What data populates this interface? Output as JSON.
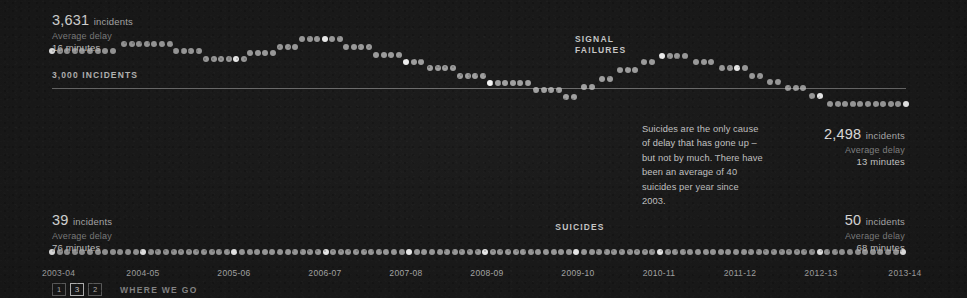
{
  "background_color": "#1a1a1a",
  "dot_color": "#c9c9c9",
  "dot_color_highlight": "#ffffff",
  "reference": {
    "label": "3,000 INCIDENTS",
    "value": 3000
  },
  "series_labels": {
    "signal_failures": "SIGNAL\nFAILURES",
    "signal_failures_line1": "SIGNAL",
    "signal_failures_line2": "FAILURES",
    "suicides": "SUICIDES"
  },
  "stats": {
    "signal_start": {
      "value": "3,631",
      "unit": "incidents",
      "sub": "Average delay",
      "delay": "16 minutes"
    },
    "signal_end": {
      "value": "2,498",
      "unit": "incidents",
      "sub": "Average delay",
      "delay": "13 minutes"
    },
    "suicides_start": {
      "value": "39",
      "unit": "incidents",
      "sub": "Average delay",
      "delay": "76 minutes"
    },
    "suicides_end": {
      "value": "50",
      "unit": "incidents",
      "sub": "Average delay",
      "delay": "68 minutes"
    }
  },
  "annotation": {
    "text": "Suicides are the only cause of delay that has gone up – but not by much. There have been an average of 40 suicides per year since 2003."
  },
  "footer": {
    "pages": [
      "1",
      "3",
      "2"
    ],
    "active_page": "3",
    "label": "WHERE WE GO"
  },
  "chart_data": {
    "type": "scatter",
    "title": "",
    "xlabel": "",
    "ylabel": "Incidents",
    "grid": false,
    "legend": "inline-annotations",
    "categories": [
      "2003-04",
      "2004-05",
      "2005-06",
      "2006-07",
      "2007-08",
      "2008-09",
      "2009-10",
      "2010-11",
      "2011-12",
      "2012-13",
      "2013-14"
    ],
    "x_tick_positions_px": [
      52,
      143,
      234,
      325,
      406,
      487,
      578,
      659,
      740,
      821,
      905
    ],
    "reference_line": {
      "label": "3,000 INCIDENTS",
      "value": 3000,
      "y_px": 88
    },
    "series": [
      {
        "name": "SIGNAL FAILURES",
        "start_value": 3631,
        "end_value": 2498,
        "start_delay_minutes": 16,
        "end_delay_minutes": 13,
        "note": "stepped dot-plot of period-by-period incident counts",
        "steps": [
          {
            "x0": 52,
            "x1": 118,
            "y": 51
          },
          {
            "x0": 124,
            "x1": 170,
            "y": 44
          },
          {
            "x0": 176,
            "x1": 200,
            "y": 51
          },
          {
            "x0": 206,
            "x1": 244,
            "y": 59
          },
          {
            "x0": 250,
            "x1": 274,
            "y": 53
          },
          {
            "x0": 280,
            "x1": 296,
            "y": 47
          },
          {
            "x0": 302,
            "x1": 340,
            "y": 39
          },
          {
            "x0": 346,
            "x1": 370,
            "y": 47
          },
          {
            "x0": 376,
            "x1": 400,
            "y": 55
          },
          {
            "x0": 406,
            "x1": 424,
            "y": 62
          },
          {
            "x0": 430,
            "x1": 454,
            "y": 68
          },
          {
            "x0": 460,
            "x1": 484,
            "y": 76
          },
          {
            "x0": 490,
            "x1": 530,
            "y": 83
          },
          {
            "x0": 536,
            "x1": 560,
            "y": 90
          },
          {
            "x0": 566,
            "x1": 578,
            "y": 97
          },
          {
            "x0": 584,
            "x1": 596,
            "y": 87
          },
          {
            "x0": 602,
            "x1": 614,
            "y": 79
          },
          {
            "x0": 620,
            "x1": 638,
            "y": 70
          },
          {
            "x0": 644,
            "x1": 656,
            "y": 62
          },
          {
            "x0": 662,
            "x1": 690,
            "y": 56
          },
          {
            "x0": 696,
            "x1": 716,
            "y": 62
          },
          {
            "x0": 722,
            "x1": 746,
            "y": 68
          },
          {
            "x0": 752,
            "x1": 764,
            "y": 76
          },
          {
            "x0": 770,
            "x1": 782,
            "y": 82
          },
          {
            "x0": 788,
            "x1": 806,
            "y": 88
          },
          {
            "x0": 812,
            "x1": 824,
            "y": 96
          },
          {
            "x0": 830,
            "x1": 906,
            "y": 104
          }
        ]
      },
      {
        "name": "SUICIDES",
        "start_value": 39,
        "end_value": 50,
        "start_delay_minutes": 76,
        "end_delay_minutes": 68,
        "average_per_year": 40,
        "since_year": 2003,
        "flat_y_px": 252,
        "x0": 52,
        "x1": 906
      }
    ]
  }
}
